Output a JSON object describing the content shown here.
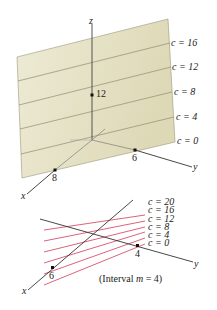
{
  "top_diagram": {
    "axes": {
      "x_label": "x",
      "y_label": "y",
      "z_label": "z"
    },
    "intercepts": {
      "x": "8",
      "y": "6",
      "z": "12"
    },
    "level_labels": [
      "c = 16",
      "c = 12",
      "c = 8",
      "c = 4",
      "c = 0"
    ],
    "plane_color": "#e6e2c6",
    "line_color": "#8f8b73"
  },
  "bottom_diagram": {
    "axes": {
      "x_label": "x",
      "y_label": "y"
    },
    "intercepts": {
      "x": "6",
      "y": "4"
    },
    "level_labels": [
      "c = 20",
      "c = 16",
      "c = 12",
      "c = 8",
      "c = 4",
      "c = 0"
    ],
    "line_color": "#d9506a",
    "caption_prefix": "(Interval ",
    "caption_var": "m",
    "caption_suffix": " = 4)"
  }
}
